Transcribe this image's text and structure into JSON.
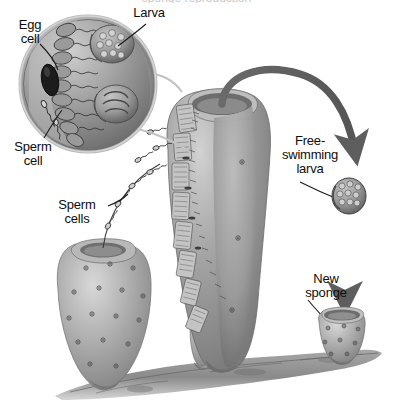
{
  "figure": {
    "background_color": "#ffffff",
    "width": 393,
    "height": 419,
    "clipped_header_text": "sponge reproduction"
  },
  "labels": {
    "egg_cell": "Egg\ncell",
    "larva": "Larva",
    "sperm_cell": "Sperm\ncell",
    "sperm_cells": "Sperm\ncells",
    "free_swimming_larva": "Free-\nswimming\nlarva",
    "new_sponge": "New\nsponge"
  },
  "colors": {
    "label_text": "#0d0d0d",
    "leader_line": "#1a1a1a",
    "arrow_dark": "#5e5e5e",
    "sponge_mid": "#9a9a9a",
    "sponge_light": "#c6c6c6",
    "sponge_dark": "#6f6f6f",
    "inset_ring": "#b4b4b4",
    "substrate": "#8c8c8c",
    "egg_cell": "#1c1c1c",
    "connector": "#c2c2c2"
  },
  "elements": {
    "inset_circle": "magnified cutaway of sponge wall showing choanocytes, egg cell, sperm and developing larvae",
    "left_sponge": "adult sponge releasing sperm cells from its osculum",
    "center_sponge": "adult sponge with cutaway wall, receives sperm and releases larva",
    "small_sponge": "small juvenile sponge between left and center sponges",
    "free_larva": "free-swimming ciliated larva",
    "new_sponge": "newly settled juvenile sponge",
    "substrate": "rocky sea floor substrate"
  },
  "flow": {
    "steps": [
      "Sperm cells released from left sponge",
      "Sperm swim to center sponge and fertilize egg cell",
      "Larva develops inside the sponge wall",
      "Free-swimming larva exits through the osculum",
      "Larva settles and grows into a new sponge"
    ]
  }
}
